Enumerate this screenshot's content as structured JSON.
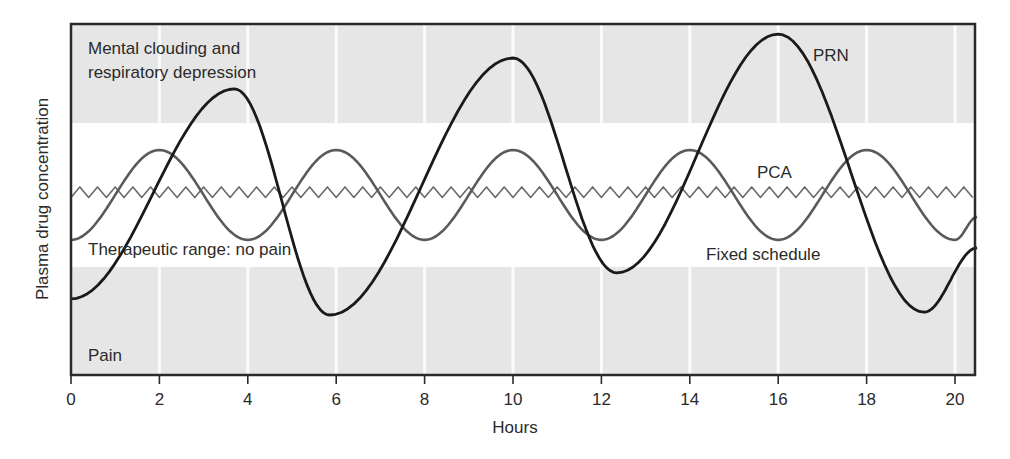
{
  "chart_data": {
    "type": "line",
    "title": "",
    "xlabel": "Hours",
    "ylabel": "Plasma drug concentration",
    "xlim": [
      0,
      20.5
    ],
    "ylim": [
      0,
      100
    ],
    "x_ticks": [
      0,
      2,
      4,
      6,
      8,
      10,
      12,
      14,
      16,
      18,
      20
    ],
    "y_ticks": [],
    "grid": "vertical white lines at every 2 hours inside shaded bands",
    "legend": "none — series labelled inline",
    "bands": [
      {
        "name": "toxic",
        "label_lines": [
          "Mental clouding and",
          "respiratory depression"
        ],
        "from": 71.8,
        "to": 100,
        "shaded": true
      },
      {
        "name": "therapeutic",
        "label": "Therapeutic range: no pain",
        "from": 30.8,
        "to": 71.8,
        "shaded": false
      },
      {
        "name": "pain",
        "label": "Pain",
        "from": 0,
        "to": 30.8,
        "shaded": true
      }
    ],
    "series": [
      {
        "name": "PRN",
        "label": "PRN",
        "color": "#1a1a1a",
        "x": [
          0,
          3.7,
          5.85,
          10.0,
          12.35,
          16.0,
          19.3,
          20.5
        ],
        "y": [
          21.7,
          81.5,
          17.1,
          90.3,
          29.1,
          97.1,
          17.9,
          36.2
        ],
        "kind": "extrema"
      },
      {
        "name": "Fixed schedule",
        "label": "Fixed schedule",
        "color": "#5a5a5a",
        "x": [
          0,
          2,
          4,
          6,
          8,
          10,
          12,
          14,
          16,
          18,
          20,
          20.5
        ],
        "y": [
          38.5,
          64.1,
          38.5,
          64.1,
          38.5,
          64.1,
          38.5,
          64.1,
          38.5,
          64.1,
          38.5,
          45.0
        ],
        "kind": "extrema"
      },
      {
        "name": "PCA",
        "label": "PCA",
        "color": "#6a6a6a",
        "mean": 52.1,
        "amplitude": 1.5,
        "period_hours": 0.4,
        "kind": "oscillation"
      }
    ],
    "annotations": [
      {
        "text": "PRN",
        "x": 16.6,
        "y": 93
      },
      {
        "text": "PCA",
        "x": 15.8,
        "y": 57
      },
      {
        "text": "Fixed schedule",
        "x": 13.8,
        "y": 34
      },
      {
        "text": "Therapeutic range: no pain",
        "x": 0.4,
        "y": 34
      },
      {
        "text": "Mental clouding and respiratory depression",
        "x": 0.4,
        "y": 93
      },
      {
        "text": "Pain",
        "x": 0.4,
        "y": 4
      }
    ]
  },
  "labels": {
    "toxic_line1": "Mental clouding and",
    "toxic_line2": "respiratory depression",
    "therapeutic": "Therapeutic range: no pain",
    "pain": "Pain",
    "prn": "PRN",
    "pca": "PCA",
    "fixed": "Fixed schedule",
    "xlabel": "Hours",
    "ylabel": "Plasma drug concentration",
    "ticks": [
      "0",
      "2",
      "4",
      "6",
      "8",
      "10",
      "12",
      "14",
      "16",
      "18",
      "20"
    ]
  },
  "colors": {
    "band_fill": "#e6e6e6",
    "gridline": "#fbfbfb",
    "axis": "#2a2a2a",
    "prn": "#1a1a1a",
    "fixed": "#5a5a5a",
    "pca": "#6a6a6a"
  }
}
